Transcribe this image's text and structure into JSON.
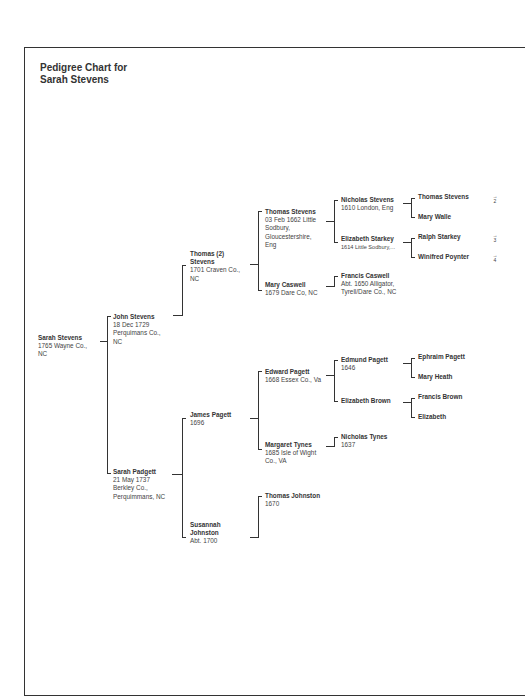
{
  "title": [
    "Pedigree Chart for",
    "Sarah Stevens"
  ],
  "people": {
    "p1": {
      "name": "Sarah Stevens",
      "details": [
        "1765 Wayne Co.,",
        "NC"
      ]
    },
    "p2": {
      "name": "John Stevens",
      "details": [
        "18 Dec 1729",
        "Perquimans Co.,",
        "NC"
      ]
    },
    "p3": {
      "name": "Sarah Padgett",
      "details": [
        "21 May 1737",
        "Berkley Co.,",
        "Perquimmans, NC"
      ]
    },
    "p4": {
      "name": "Thomas (2) Stevens",
      "details": [
        "1701 Craven Co.,",
        "NC"
      ]
    },
    "p5": {
      "name": "James Pagett",
      "details": [
        "1696"
      ]
    },
    "p6": {
      "name": "Susannah Johnston",
      "details": [
        "Abt. 1700"
      ]
    },
    "p7": {
      "name": "Thomas Stevens",
      "details": [
        "03 Feb 1662 Little",
        "Sodbury,",
        "Gloucestershire,",
        "Eng"
      ]
    },
    "p8": {
      "name": "Mary Caswell",
      "details": [
        "1679 Dare Co, NC"
      ]
    },
    "p9": {
      "name": "Edward Pagett",
      "details": [
        "1668 Essex Co., Va"
      ]
    },
    "p10": {
      "name": "Margaret Tynes",
      "details": [
        "1685 Isle of Wight",
        "Co., VA"
      ]
    },
    "p11": {
      "name": "Thomas Johnston",
      "details": [
        "1670"
      ]
    },
    "p12": {
      "name": "Nicholas Stevens",
      "details": [
        "1610 London, Eng"
      ]
    },
    "p13": {
      "name": "Elizabeth Starkey",
      "details": [
        "1614 Little Sodbury,..."
      ]
    },
    "p14": {
      "name": "Francis Caswell",
      "details": [
        "Abt. 1650 Alligator,",
        "Tyrell/Dare Co., NC"
      ]
    },
    "p15": {
      "name": "Edmund Pagett",
      "details": [
        "1646"
      ]
    },
    "p16": {
      "name": "Elizabeth Brown",
      "details": []
    },
    "p17": {
      "name": "Nicholas Tynes",
      "details": [
        "1637"
      ]
    },
    "p18": {
      "name": "Thomas Stevens",
      "details": []
    },
    "p19": {
      "name": "Mary Walle",
      "details": []
    },
    "p20": {
      "name": "Ralph Starkey",
      "details": []
    },
    "p21": {
      "name": "Winifred Poynter",
      "details": []
    },
    "p22": {
      "name": "Ephraim Pagett",
      "details": []
    },
    "p23": {
      "name": "Mary Heath",
      "details": []
    },
    "p24": {
      "name": "Francis Brown",
      "details": []
    },
    "p25": {
      "name": "Elizabeth",
      "details": []
    }
  },
  "continuations": [
    {
      "arrow": "→",
      "chart": "2"
    },
    {
      "arrow": "→",
      "chart": "3"
    },
    {
      "arrow": "→",
      "chart": "4"
    }
  ]
}
